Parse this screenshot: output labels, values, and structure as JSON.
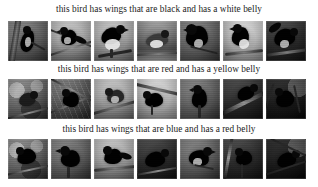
{
  "page": {
    "background_color": "#ffffff",
    "text_color": "#1b1b1b",
    "width": 318,
    "height": 187,
    "columns": 7,
    "rows": 3
  },
  "rows": [
    {
      "caption": "this bird has wings that are black and has a white belly",
      "images": [
        {
          "alt": "bird-thumbnail-1-1",
          "style": "bg-mid",
          "desc": "dark bird perched on vertical branch"
        },
        {
          "alt": "bird-thumbnail-1-2",
          "style": "bg-light",
          "desc": "dark bird on crossing twigs"
        },
        {
          "alt": "bird-thumbnail-1-3",
          "style": "bg-light",
          "desc": "bird with white belly on branch"
        },
        {
          "alt": "bird-thumbnail-1-4",
          "style": "bg-water",
          "desc": "bird on water surface"
        },
        {
          "alt": "bird-thumbnail-1-5",
          "style": "bg-mid",
          "desc": "dark bird close up on perch"
        },
        {
          "alt": "bird-thumbnail-1-6",
          "style": "bg-sky",
          "desc": "bird silhouette against pale sky"
        },
        {
          "alt": "bird-thumbnail-1-7",
          "style": "bg-dark",
          "desc": "bird with spread wings on branch"
        }
      ]
    },
    {
      "caption": "this bird has wings that are red and has a yellow belly",
      "images": [
        {
          "alt": "bird-thumbnail-2-1",
          "style": "bg-leaf",
          "desc": "bird among leaves on branch"
        },
        {
          "alt": "bird-thumbnail-2-2",
          "style": "bg-brush",
          "desc": "bird in tangled branches"
        },
        {
          "alt": "bird-thumbnail-2-3",
          "style": "bg-light",
          "desc": "bird perched on thin branch"
        },
        {
          "alt": "bird-thumbnail-2-4",
          "style": "bg-sky",
          "desc": "bird on branch bright background"
        },
        {
          "alt": "bird-thumbnail-2-5",
          "style": "bg-mid",
          "desc": "dark bird on vertical stem"
        },
        {
          "alt": "bird-thumbnail-2-6",
          "style": "bg-dark",
          "desc": "bird on diagonal branch"
        },
        {
          "alt": "bird-thumbnail-2-7",
          "style": "bg-night",
          "desc": "bird in dark foliage"
        }
      ]
    },
    {
      "caption": "this bird has wings that are blue and has a red belly",
      "images": [
        {
          "alt": "bird-thumbnail-3-1",
          "style": "bg-leaf",
          "desc": "bird in dense branches"
        },
        {
          "alt": "bird-thumbnail-3-2",
          "style": "bg-mid",
          "desc": "bird perched looking left"
        },
        {
          "alt": "bird-thumbnail-3-3",
          "style": "bg-light",
          "desc": "bird on horizontal branch"
        },
        {
          "alt": "bird-thumbnail-3-4",
          "style": "bg-dark",
          "desc": "dark bird on branch"
        },
        {
          "alt": "bird-thumbnail-3-5",
          "style": "bg-mid",
          "desc": "bird perched facing right"
        },
        {
          "alt": "bird-thumbnail-3-6",
          "style": "bg-dark",
          "desc": "bird on narrow perch"
        },
        {
          "alt": "bird-thumbnail-3-7",
          "style": "bg-night",
          "desc": "bird among dark twigs"
        }
      ]
    }
  ]
}
